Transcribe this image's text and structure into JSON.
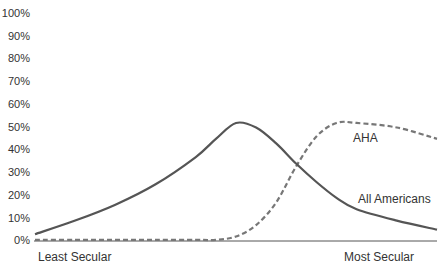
{
  "chart_data": {
    "type": "line",
    "title": "",
    "xlabel": "",
    "ylabel": "",
    "x_tick_labels": [
      "Least Secular",
      "Most Secular"
    ],
    "y_tick_labels": [
      "0%",
      "10%",
      "20%",
      "30%",
      "40%",
      "50%",
      "60%",
      "70%",
      "80%",
      "90%",
      "100%"
    ],
    "ylim": [
      0,
      100
    ],
    "grid": false,
    "x": [
      0,
      0.1,
      0.2,
      0.3,
      0.4,
      0.45,
      0.5,
      0.55,
      0.6,
      0.65,
      0.7,
      0.75,
      0.8,
      0.9,
      1.0
    ],
    "series": [
      {
        "name": "All Americans",
        "style": "solid",
        "values": [
          3,
          9,
          16,
          25,
          37,
          45,
          52,
          50,
          43,
          34,
          26,
          19,
          14,
          9,
          5
        ]
      },
      {
        "name": "AHA",
        "style": "dashed",
        "values": [
          0.5,
          0.5,
          0.5,
          0.5,
          0.5,
          0.5,
          2,
          7,
          17,
          33,
          46,
          52,
          52,
          50,
          45
        ]
      }
    ],
    "annotations": [
      {
        "text": "AHA",
        "series": "AHA"
      },
      {
        "text": "All Americans",
        "series": "All Americans"
      }
    ]
  },
  "labels": {
    "y": [
      "100%",
      "90%",
      "80%",
      "70%",
      "60%",
      "50%",
      "40%",
      "30%",
      "20%",
      "10%",
      "0%"
    ],
    "x_left": "Least Secular",
    "x_right": "Most Secular",
    "aha": "AHA",
    "all": "All Americans"
  }
}
